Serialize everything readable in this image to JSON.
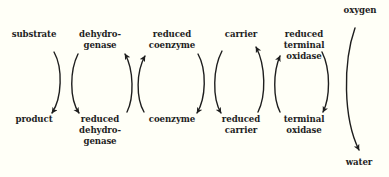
{
  "diagram": {
    "type": "electron-transport-chain",
    "colors": {
      "background": "#fffff7",
      "ink": "#1e1e1e"
    },
    "top_labels": [
      {
        "id": "substrate",
        "lines": [
          "substrate"
        ]
      },
      {
        "id": "dehydrogenase",
        "lines": [
          "dehydro-",
          "genase"
        ]
      },
      {
        "id": "reduced-coenzyme",
        "lines": [
          "reduced",
          "coenzyme"
        ]
      },
      {
        "id": "carrier",
        "lines": [
          "carrier"
        ]
      },
      {
        "id": "reduced-terminal-oxidase",
        "lines": [
          "reduced",
          "terminal",
          "oxidase"
        ]
      },
      {
        "id": "oxygen",
        "lines": [
          "oxygen"
        ]
      }
    ],
    "bottom_labels": [
      {
        "id": "product",
        "lines": [
          "product"
        ]
      },
      {
        "id": "reduced-dehydrogenase",
        "lines": [
          "reduced",
          "dehydro-",
          "genase"
        ]
      },
      {
        "id": "coenzyme",
        "lines": [
          "coenzyme"
        ]
      },
      {
        "id": "reduced-carrier",
        "lines": [
          "reduced",
          "carrier"
        ]
      },
      {
        "id": "terminal-oxidase",
        "lines": [
          "terminal",
          "oxidase"
        ]
      },
      {
        "id": "water",
        "lines": [
          "water"
        ]
      }
    ],
    "arrows": [
      {
        "from": "substrate",
        "to": "product",
        "direction": "down"
      },
      {
        "from": "dehydrogenase",
        "to": "reduced-dehydrogenase",
        "direction": "down"
      },
      {
        "from": "reduced-dehydrogenase",
        "to": "dehydrogenase",
        "direction": "up"
      },
      {
        "from": "coenzyme",
        "to": "reduced-coenzyme",
        "direction": "up"
      },
      {
        "from": "reduced-coenzyme",
        "to": "coenzyme",
        "direction": "down"
      },
      {
        "from": "carrier",
        "to": "reduced-carrier",
        "direction": "down"
      },
      {
        "from": "reduced-carrier",
        "to": "carrier",
        "direction": "up"
      },
      {
        "from": "terminal-oxidase",
        "to": "reduced-terminal-oxidase",
        "direction": "up"
      },
      {
        "from": "reduced-terminal-oxidase",
        "to": "terminal-oxidase",
        "direction": "down"
      },
      {
        "from": "oxygen",
        "to": "water",
        "direction": "down"
      }
    ]
  }
}
